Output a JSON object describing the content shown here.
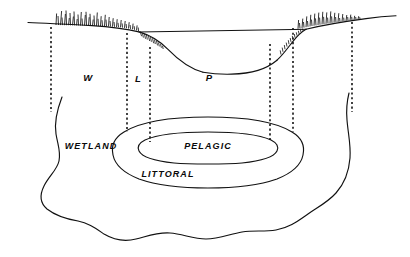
{
  "figure": {
    "background_color": "#ffffff",
    "ink_color": "#111111",
    "width": 410,
    "height": 257
  },
  "cross_section": {
    "name": "lake-cross-section",
    "water_surface_label": "water-surface-line",
    "zone_codes": [
      {
        "id": "wetland-code",
        "label": "W",
        "x": 88,
        "y": 78,
        "meaning": "Wetland"
      },
      {
        "id": "littoral-code",
        "label": "L",
        "x": 138,
        "y": 79,
        "meaning": "Littoral"
      },
      {
        "id": "pelagic-code",
        "label": "P",
        "x": 209,
        "y": 78,
        "meaning": "Pelagic"
      }
    ]
  },
  "plan_view": {
    "name": "lake-plan-view",
    "zone_names": [
      {
        "id": "wetland-name",
        "label": "WETLAND",
        "x": 91,
        "y": 147
      },
      {
        "id": "pelagic-name",
        "label": "PELAGIC",
        "x": 208,
        "y": 147
      },
      {
        "id": "littoral-name",
        "label": "LITTORAL",
        "x": 168,
        "y": 175
      }
    ]
  },
  "dividers": {
    "name": "zone-boundary-dashed-lines",
    "lines": [
      {
        "id": "divider-outer-left",
        "x": 51,
        "y1": 27,
        "y2": 112
      },
      {
        "id": "divider-wetland-littoral-left",
        "x": 127,
        "y1": 33,
        "y2": 132
      },
      {
        "id": "divider-littoral-pelagic-left",
        "x": 150,
        "y1": 47,
        "y2": 142
      },
      {
        "id": "divider-littoral-pelagic-right",
        "x": 270,
        "y1": 44,
        "y2": 142
      },
      {
        "id": "divider-wetland-littoral-right",
        "x": 293,
        "y1": 28,
        "y2": 132
      },
      {
        "id": "divider-outer-right",
        "x": 352,
        "y1": 22,
        "y2": 112
      }
    ]
  }
}
